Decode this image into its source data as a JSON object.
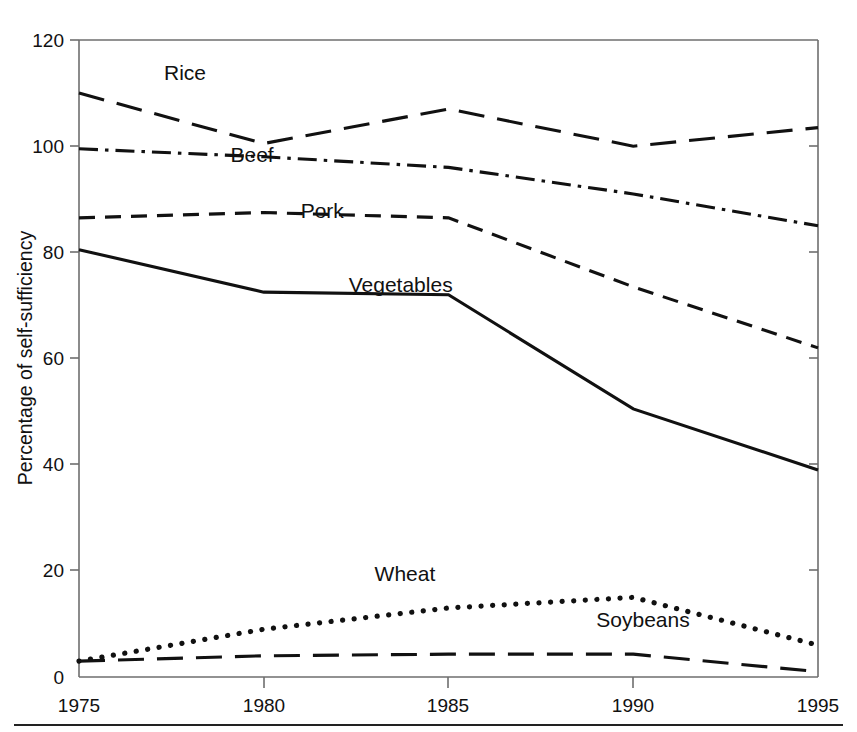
{
  "chart_data": {
    "type": "line",
    "title": "",
    "xlabel": "",
    "ylabel": "Percentage of self-sufficiency",
    "x": [
      1975,
      1980,
      1985,
      1990,
      1995
    ],
    "xtick_labels": [
      "1975",
      "1980",
      "1985",
      "1990",
      "1995"
    ],
    "ytick_labels": [
      "0",
      "20",
      "40",
      "60",
      "80",
      "100",
      "120"
    ],
    "ytick_values": [
      0,
      20,
      40,
      60,
      80,
      100,
      120
    ],
    "xlim": [
      1975,
      1995
    ],
    "ylim": [
      0,
      120
    ],
    "grid": false,
    "legend_position": "inline-labels",
    "series": [
      {
        "name": "Rice",
        "label": "Rice",
        "style": "long-dash",
        "values": [
          110,
          100.5,
          107,
          100,
          103.5
        ],
        "label_x": 1977.3,
        "label_y": 112.5
      },
      {
        "name": "Beef",
        "label": "Beef",
        "style": "dash-dot",
        "values": [
          99.5,
          98,
          96,
          91,
          85
        ],
        "label_x": 1979.1,
        "label_y": 97.0
      },
      {
        "name": "Pork",
        "label": "Pork",
        "style": "medium-dash",
        "values": [
          86.5,
          87.5,
          86.5,
          73.5,
          62
        ],
        "label_x": 1981.0,
        "label_y": 86.5
      },
      {
        "name": "Vegetables",
        "label": "Vegetables",
        "style": "solid",
        "values": [
          80.5,
          72.5,
          72,
          50.5,
          39
        ],
        "label_x": 1982.3,
        "label_y": 72.5
      },
      {
        "name": "Wheat",
        "label": "Wheat",
        "style": "dotted",
        "values": [
          3,
          9,
          13,
          15,
          6
        ],
        "label_x": 1983.0,
        "label_y": 18.0
      },
      {
        "name": "Soybeans",
        "label": "Soybeans",
        "style": "long-dash",
        "values": [
          3,
          4,
          4.3,
          4.3,
          1
        ],
        "label_x": 1989.0,
        "label_y": 9.5
      }
    ]
  },
  "axes": {
    "y_axis_title": "Percentage of self-sufficiency",
    "y_ticks": [
      "120",
      "100",
      "80",
      "60",
      "40",
      "20",
      "0"
    ],
    "x_ticks": [
      "1975",
      "1980",
      "1985",
      "1990",
      "1995"
    ]
  },
  "labels": {
    "rice": "Rice",
    "beef": "Beef",
    "pork": "Pork",
    "vegetables": "Vegetables",
    "wheat": "Wheat",
    "soybeans": "Soybeans"
  },
  "colors": {
    "ink": "#111111",
    "axis": "#6e6e6e",
    "background": "#ffffff",
    "rule": "#222222"
  }
}
